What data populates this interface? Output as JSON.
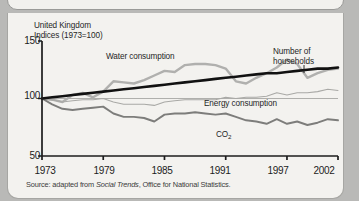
{
  "figure": {
    "title_line1": "United Kingdom",
    "title_line2": "Indices (1973=100)",
    "source_prefix": "Source: adapted from ",
    "source_italic": "Social Trends",
    "source_suffix": ", Office for National Statistics."
  },
  "chart_data": {
    "type": "line",
    "title": "United Kingdom Indices (1973=100)",
    "xlabel": "",
    "ylabel": "Indices (1973=100)",
    "xlim": [
      1973,
      2002
    ],
    "ylim": [
      50,
      150
    ],
    "yticks": [
      50,
      100,
      150
    ],
    "xticks": [
      1973,
      1979,
      1985,
      1991,
      1997,
      2002
    ],
    "grid": "single horizontal reference line at 100",
    "legend": "inline series labels",
    "x": [
      1973,
      1974,
      1975,
      1976,
      1977,
      1978,
      1979,
      1980,
      1981,
      1982,
      1983,
      1984,
      1985,
      1986,
      1987,
      1988,
      1989,
      1990,
      1991,
      1992,
      1993,
      1994,
      1995,
      1996,
      1997,
      1998,
      1999,
      2000,
      2001,
      2002
    ],
    "series": [
      {
        "name": "Water consumption",
        "color": "#b0b0ae",
        "width": 2.4,
        "values": [
          100,
          99,
          97,
          103,
          105,
          101,
          106,
          115,
          114,
          113,
          116,
          120,
          124,
          123,
          129,
          130,
          130,
          129,
          126,
          115,
          113,
          118,
          122,
          127,
          134,
          130,
          118,
          122,
          125,
          126
        ]
      },
      {
        "name": "Number of households",
        "color": "#111111",
        "width": 2.6,
        "values": [
          100,
          101,
          102,
          103,
          104,
          105,
          106,
          107,
          108,
          109,
          110,
          111,
          112,
          113,
          114,
          115,
          116,
          117,
          118,
          119,
          120,
          121,
          122,
          122,
          123,
          124,
          125,
          126,
          126,
          127
        ]
      },
      {
        "name": "Energy consumption",
        "color": "#a9a9a6",
        "width": 1.1,
        "values": [
          100,
          99,
          97,
          98,
          99,
          99,
          100,
          97,
          95,
          95,
          95,
          94,
          97,
          98,
          99,
          99,
          99,
          99,
          101,
          100,
          101,
          101,
          102,
          105,
          103,
          105,
          105,
          106,
          108,
          107
        ]
      },
      {
        "name": "CO2",
        "label": "CO₂",
        "color": "#7d7d7b",
        "width": 1.9,
        "values": [
          100,
          95,
          91,
          90,
          91,
          92,
          93,
          87,
          84,
          84,
          83,
          80,
          86,
          87,
          87,
          88,
          87,
          86,
          87,
          84,
          81,
          80,
          78,
          82,
          78,
          80,
          77,
          79,
          82,
          81
        ]
      }
    ],
    "annotations": [
      {
        "text": "Water consumption",
        "x": 1982,
        "y": 140
      },
      {
        "text": "Number of households",
        "x": 1999,
        "y": 143
      },
      {
        "text": "Energy consumption",
        "x": 1994,
        "y": 103
      },
      {
        "text": "CO₂",
        "x": 1993,
        "y": 73
      }
    ]
  },
  "axes": {
    "y_ticks": [
      "150",
      "100",
      "50"
    ],
    "x_ticks": [
      "1973",
      "1979",
      "1985",
      "1991",
      "1997",
      "2002"
    ]
  },
  "labels": {
    "water": "Water consumption",
    "households_line1": "Number of",
    "households_line2": "households",
    "energy": "Energy consumption",
    "co2": "CO",
    "co2_sub": "2"
  }
}
